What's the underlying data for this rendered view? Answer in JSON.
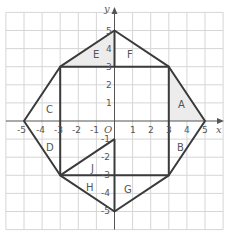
{
  "axes": {
    "x_label": "x",
    "y_label": "y",
    "origin_label": "O",
    "x_ticks": [
      "-5",
      "-4",
      "-3",
      "-2",
      "-1",
      "1",
      "2",
      "3",
      "4",
      "5"
    ],
    "y_ticks": [
      "5",
      "4",
      "3",
      "2",
      "1",
      "-1",
      "-2",
      "-3",
      "-4",
      "-5"
    ]
  },
  "shape": {
    "outer_octagon": [
      [
        0,
        5
      ],
      [
        3,
        3
      ],
      [
        5,
        0
      ],
      [
        3,
        -3
      ],
      [
        0,
        -5
      ],
      [
        -3,
        -3
      ],
      [
        -5,
        0
      ],
      [
        -3,
        3
      ]
    ],
    "inner_square": [
      [
        -3,
        3
      ],
      [
        3,
        3
      ],
      [
        3,
        -3
      ],
      [
        -3,
        -3
      ]
    ],
    "extra_segments": [
      [
        [
          0,
          5
        ],
        [
          0,
          3
        ]
      ],
      [
        [
          0,
          -1
        ],
        [
          0,
          -5
        ]
      ],
      [
        [
          -3,
          -3
        ],
        [
          0,
          -1
        ]
      ],
      [
        [
          3,
          0
        ],
        [
          3,
          3
        ]
      ]
    ]
  },
  "regions": {
    "A": "A",
    "B": "B",
    "C": "C",
    "D": "D",
    "E": "E",
    "F": "F",
    "G": "G",
    "H": "H",
    "J": "J"
  },
  "shaded_regions": [
    "A",
    "E"
  ],
  "colors": {
    "line": "#3a3a3a",
    "shade": "#ececec",
    "grid": "#d6d6d6"
  }
}
